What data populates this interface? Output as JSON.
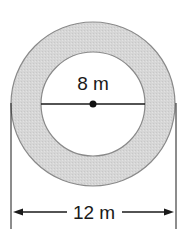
{
  "diagram": {
    "type": "annulus",
    "inner_label": "8 m",
    "outer_label": "12 m",
    "inner_diameter": 8,
    "outer_diameter": 12,
    "unit": "m",
    "colors": {
      "ring_fill": "#d9d9d9",
      "ring_stroke": "#8a8a8a",
      "line": "#1a1a1a",
      "inner_fill": "#ffffff"
    }
  }
}
